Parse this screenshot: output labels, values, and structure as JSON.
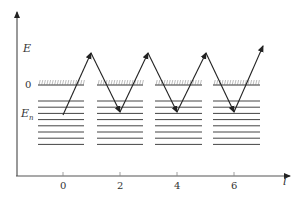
{
  "diagram": {
    "y_axis": {
      "label": "E",
      "zero_label": "0",
      "level_label": "E",
      "level_subscript": "n"
    },
    "x_axis": {
      "label": "l",
      "ticks": [
        {
          "label": "0",
          "x": 63
        },
        {
          "label": "2",
          "x": 120
        },
        {
          "label": "4",
          "x": 177
        },
        {
          "label": "6",
          "x": 234
        }
      ]
    },
    "surface_segments": [
      {
        "x1": 38,
        "x2": 84
      },
      {
        "x1": 97,
        "x2": 143
      },
      {
        "x1": 155,
        "x2": 202
      },
      {
        "x1": 213,
        "x2": 260
      }
    ],
    "level_count": 8,
    "surface_y": 85,
    "level_start_y": 101,
    "level_spacing": 6.2,
    "zigzag_points": [
      [
        63,
        115
      ],
      [
        91,
        53
      ],
      [
        120,
        112
      ],
      [
        148,
        53
      ],
      [
        177,
        112
      ],
      [
        206,
        53
      ],
      [
        234,
        112
      ],
      [
        263,
        46
      ]
    ],
    "colors": {
      "line": "#333333",
      "axis": "#555555",
      "levels": "#444444"
    }
  }
}
